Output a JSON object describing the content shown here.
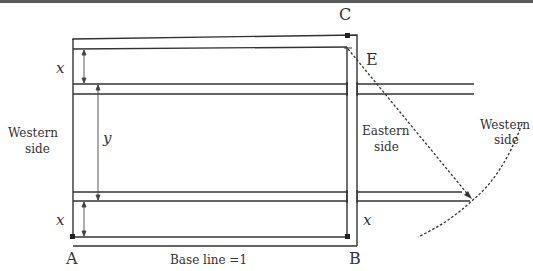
{
  "diagram": {
    "points": {
      "A": "A",
      "B": "B",
      "C": "C",
      "E": "E"
    },
    "labels": {
      "x_top": "x",
      "x_bottom": "x",
      "x_right": "x",
      "y": "y",
      "western_side_left_line1": "Western",
      "western_side_left_line2": "side",
      "eastern_side_line1": "Eastern",
      "eastern_side_line2": "side",
      "western_side_right_line1": "Western",
      "western_side_right_line2": "side",
      "base_line": "Base line =1"
    },
    "colors": {
      "line": "#333333",
      "text": "#333333"
    }
  }
}
